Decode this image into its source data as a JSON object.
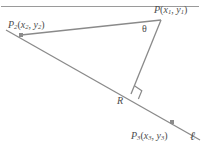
{
  "figure": {
    "background_color": "#ffffff",
    "stroke_color": "#8a8a8a",
    "label_color": "#4c4c4c",
    "rule_color": "#9a9a9a",
    "width": 206,
    "height": 147
  },
  "labels": {
    "p1": {
      "base": "P",
      "sub": "",
      "open": "(",
      "x": "x",
      "xsub": "1",
      "comma": ", ",
      "y": "y",
      "ysub": "1",
      "close": ")"
    },
    "p2": {
      "base": "P",
      "sub": "2",
      "open": "(",
      "x": "x",
      "xsub": "2",
      "comma": ", ",
      "y": "y",
      "ysub": "2",
      "close": ")"
    },
    "p3": {
      "base": "P",
      "sub": "3",
      "open": "(",
      "x": "x",
      "xsub": "3",
      "comma": ", ",
      "y": "y",
      "ysub": "3",
      "close": ")"
    },
    "r": "R",
    "theta": "θ",
    "line": "ℓ",
    "top_fragment": "g"
  },
  "geometry": {
    "points": {
      "P1": {
        "x": 161,
        "y": 20
      },
      "P2": {
        "x": 21,
        "y": 35
      },
      "P3": {
        "x": 172,
        "y": 122
      },
      "R": {
        "x": 131,
        "y": 94
      }
    },
    "line_ell": {
      "x1": 6,
      "y1": 30,
      "x2": 200,
      "y2": 140
    },
    "segment_p2_p1": {
      "x1": 21,
      "y1": 35,
      "x2": 161,
      "y2": 20
    },
    "segment_p1_r": {
      "x1": 161,
      "y1": 20,
      "x2": 131,
      "y2": 94
    },
    "right_angle_marker": {
      "x": 124,
      "y": 85,
      "size": 9
    },
    "top_rule": {
      "x1": 1,
      "y1": 6.5,
      "x2": 199,
      "y2": 6.5
    }
  },
  "markers": {
    "vertex_size": 4,
    "vertex_color": "#8c8c8c"
  }
}
